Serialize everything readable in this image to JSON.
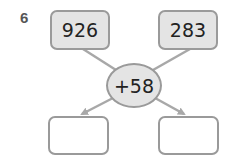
{
  "question": {
    "number": "6"
  },
  "inputs": [
    {
      "value": "926"
    },
    {
      "value": "283"
    }
  ],
  "operation": {
    "label": "+58"
  },
  "outputs": [
    {
      "value": ""
    },
    {
      "value": ""
    }
  ],
  "colors": {
    "box_fill": "#e4e4e4",
    "border": "#9a9a9a",
    "arrow": "#a8a8a8",
    "text": "#222222"
  }
}
